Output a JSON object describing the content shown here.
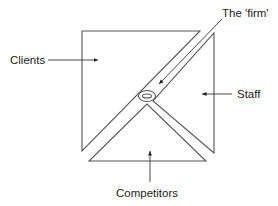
{
  "diagram": {
    "labels": {
      "firm": "The 'firm'",
      "clients": "Clients",
      "staff": "Staff",
      "competitors": "Competitors"
    },
    "colors": {
      "stroke": "#555555",
      "text": "#222222",
      "background": "#ffffff"
    }
  }
}
